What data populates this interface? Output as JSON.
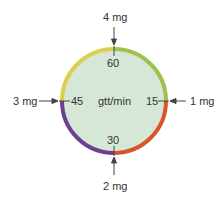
{
  "diagram": {
    "center_label": "gtt/min",
    "dial_numbers": {
      "top": "60",
      "right": "15",
      "bottom": "30",
      "left": "45"
    },
    "doses": {
      "top": "4 mg",
      "right": "1 mg",
      "bottom": "2 mg",
      "left": "3 mg"
    },
    "colors": {
      "fill": "#d6e7d8",
      "q1_top_right": "#9dc24c",
      "q2_bottom_right": "#d9552c",
      "q3_bottom_left": "#6e3f8e",
      "q4_top_left": "#dccf4c",
      "arrow": "#444444"
    }
  }
}
